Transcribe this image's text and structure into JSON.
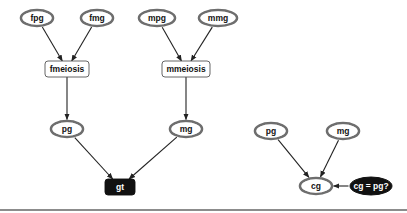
{
  "diagram": {
    "colors": {
      "node_stroke": "#6e6e6e",
      "node_fill": "#ffffff",
      "dark_fill": "#111111",
      "dark_text": "#ffffff",
      "text": "#111111",
      "edge": "#222222"
    },
    "left_graph": {
      "nodes": [
        {
          "id": "fpg",
          "label": "fpg",
          "shape": "ellipse-double",
          "style": "light"
        },
        {
          "id": "fmg",
          "label": "fmg",
          "shape": "ellipse-double",
          "style": "light"
        },
        {
          "id": "mpg",
          "label": "mpg",
          "shape": "ellipse-double",
          "style": "light"
        },
        {
          "id": "mmg",
          "label": "mmg",
          "shape": "ellipse-double",
          "style": "light"
        },
        {
          "id": "fmeiosis",
          "label": "fmeiosis",
          "shape": "rounded-box",
          "style": "light"
        },
        {
          "id": "mmeiosis",
          "label": "mmeiosis",
          "shape": "rounded-box",
          "style": "light"
        },
        {
          "id": "pg",
          "label": "pg",
          "shape": "ellipse-double",
          "style": "light"
        },
        {
          "id": "mg",
          "label": "mg",
          "shape": "ellipse-double",
          "style": "light"
        },
        {
          "id": "gt",
          "label": "gt",
          "shape": "rounded-box",
          "style": "dark"
        }
      ],
      "edges": [
        {
          "from": "fpg",
          "to": "fmeiosis"
        },
        {
          "from": "fmg",
          "to": "fmeiosis"
        },
        {
          "from": "mpg",
          "to": "mmeiosis"
        },
        {
          "from": "mmg",
          "to": "mmeiosis"
        },
        {
          "from": "fmeiosis",
          "to": "pg"
        },
        {
          "from": "mmeiosis",
          "to": "mg"
        },
        {
          "from": "pg",
          "to": "gt"
        },
        {
          "from": "mg",
          "to": "gt"
        }
      ]
    },
    "right_graph": {
      "nodes": [
        {
          "id": "pg2",
          "label": "pg",
          "shape": "ellipse-double",
          "style": "light"
        },
        {
          "id": "mg2",
          "label": "mg",
          "shape": "ellipse-double",
          "style": "light"
        },
        {
          "id": "cg",
          "label": "cg",
          "shape": "ellipse-double",
          "style": "light"
        },
        {
          "id": "cgpg",
          "label": "cg = pg?",
          "shape": "ellipse",
          "style": "dark"
        }
      ],
      "edges": [
        {
          "from": "pg2",
          "to": "cg"
        },
        {
          "from": "mg2",
          "to": "cg"
        },
        {
          "from": "cgpg",
          "to": "cg"
        }
      ]
    }
  }
}
